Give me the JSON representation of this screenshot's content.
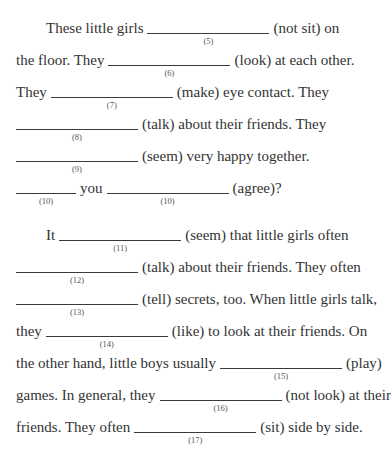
{
  "exercise": {
    "paragraphs": [
      {
        "lines": [
          {
            "indent": true,
            "top": 12,
            "parts": [
              {
                "t": "text",
                "v": "These little girls"
              },
              {
                "t": "blank",
                "n": "(5)",
                "w": "long"
              },
              {
                "t": "text",
                "v": "(not sit) on"
              }
            ]
          },
          {
            "indent": false,
            "top": 44,
            "parts": [
              {
                "t": "text",
                "v": "the floor. They"
              },
              {
                "t": "blank",
                "n": "(6)",
                "w": "long"
              },
              {
                "t": "text",
                "v": "(look) at each other."
              }
            ]
          },
          {
            "indent": false,
            "top": 76,
            "parts": [
              {
                "t": "text",
                "v": "They"
              },
              {
                "t": "blank",
                "n": "(7)",
                "w": "long"
              },
              {
                "t": "text",
                "v": "(make) eye contact. They"
              }
            ]
          },
          {
            "indent": false,
            "top": 108,
            "parts": [
              {
                "t": "blank",
                "n": "(8)",
                "w": "long"
              },
              {
                "t": "text",
                "v": "(talk) about their friends. They"
              }
            ]
          },
          {
            "indent": false,
            "top": 140,
            "parts": [
              {
                "t": "blank",
                "n": "(9)",
                "w": "long"
              },
              {
                "t": "text",
                "v": "(seem) very happy together."
              }
            ]
          },
          {
            "indent": false,
            "top": 172,
            "parts": [
              {
                "t": "blank",
                "n": "(10)",
                "w": "short"
              },
              {
                "t": "text",
                "v": "you"
              },
              {
                "t": "blank",
                "n": "(10)",
                "w": "long"
              },
              {
                "t": "text",
                "v": "(agree)?"
              }
            ]
          }
        ]
      },
      {
        "lines": [
          {
            "indent": true,
            "top": 219,
            "parts": [
              {
                "t": "text",
                "v": "It"
              },
              {
                "t": "blank",
                "n": "(11)",
                "w": "long"
              },
              {
                "t": "text",
                "v": "(seem) that little girls often"
              }
            ]
          },
          {
            "indent": false,
            "top": 251,
            "parts": [
              {
                "t": "blank",
                "n": "(12)",
                "w": "long"
              },
              {
                "t": "text",
                "v": "(talk) about their friends. They often"
              }
            ]
          },
          {
            "indent": false,
            "top": 283,
            "parts": [
              {
                "t": "blank",
                "n": "(13)",
                "w": "long"
              },
              {
                "t": "text",
                "v": "(tell) secrets, too. When little girls talk,"
              }
            ]
          },
          {
            "indent": false,
            "top": 315,
            "parts": [
              {
                "t": "text",
                "v": "they"
              },
              {
                "t": "blank",
                "n": "(14)",
                "w": "long"
              },
              {
                "t": "text",
                "v": "(like) to look at their friends. On"
              }
            ]
          },
          {
            "indent": false,
            "top": 347,
            "parts": [
              {
                "t": "text",
                "v": "the other hand, little boys usually"
              },
              {
                "t": "blank",
                "n": "(15)",
                "w": "long"
              },
              {
                "t": "text",
                "v": "(play)"
              }
            ]
          },
          {
            "indent": false,
            "top": 379,
            "parts": [
              {
                "t": "text",
                "v": "games. In general, they"
              },
              {
                "t": "blank",
                "n": "(16)",
                "w": "long"
              },
              {
                "t": "text",
                "v": "(not look) at their"
              }
            ]
          },
          {
            "indent": false,
            "top": 411,
            "parts": [
              {
                "t": "text",
                "v": "friends. They often"
              },
              {
                "t": "blank",
                "n": "(17)",
                "w": "long"
              },
              {
                "t": "text",
                "v": "(sit) side by side."
              }
            ]
          }
        ]
      }
    ]
  }
}
